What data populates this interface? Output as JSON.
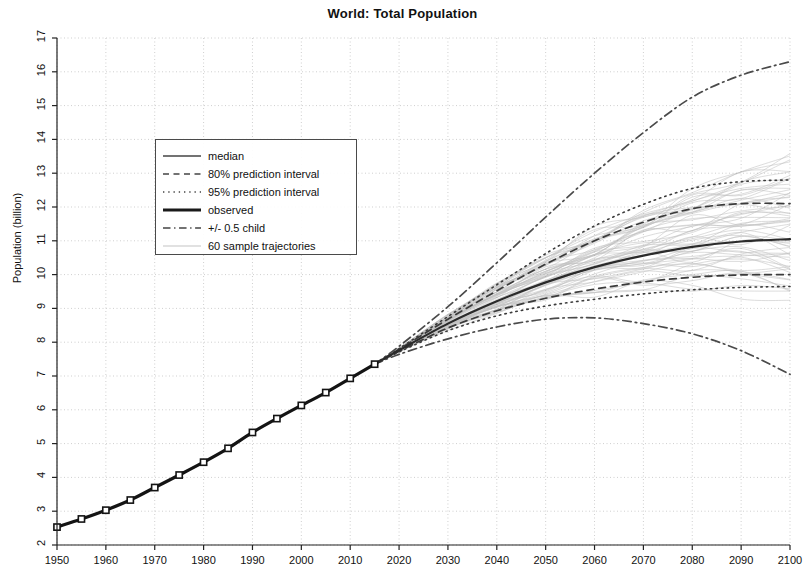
{
  "chart_data": {
    "type": "line",
    "title": "World: Total Population",
    "xlabel": "",
    "ylabel": "Population (billion)",
    "xlim": [
      1950,
      2100
    ],
    "ylim": [
      2,
      17
    ],
    "grid": true,
    "legend_position": "upper left",
    "x_ticks": [
      1950,
      1960,
      1970,
      1980,
      1990,
      2000,
      2010,
      2020,
      2030,
      2040,
      2050,
      2060,
      2070,
      2080,
      2090,
      2100
    ],
    "y_ticks": [
      2,
      3,
      4,
      5,
      6,
      7,
      8,
      9,
      10,
      11,
      12,
      13,
      14,
      15,
      16,
      17
    ],
    "legend": [
      {
        "label": "median",
        "style": "solid",
        "width": 1.5,
        "color": "#444444"
      },
      {
        "label": "80% prediction interval",
        "style": "dashed",
        "width": 1.5,
        "color": "#444444"
      },
      {
        "label": "95% prediction interval",
        "style": "dotted",
        "width": 1.5,
        "color": "#444444"
      },
      {
        "label": "observed",
        "style": "solid",
        "width": 3,
        "color": "#1a1a1a"
      },
      {
        "label": "+/- 0.5 child",
        "style": "dashdot",
        "width": 1.5,
        "color": "#444444"
      },
      {
        "label": "60 sample trajectories",
        "style": "solid",
        "width": 0.6,
        "color": "#9a9a9a"
      }
    ],
    "series": [
      {
        "name": "observed",
        "style": "solid",
        "markers": "square",
        "x": [
          1950,
          1955,
          1960,
          1965,
          1970,
          1975,
          1980,
          1985,
          1990,
          1995,
          2000,
          2005,
          2010,
          2015
        ],
        "values": [
          2.53,
          2.77,
          3.03,
          3.33,
          3.7,
          4.07,
          4.45,
          4.86,
          5.33,
          5.74,
          6.13,
          6.51,
          6.93,
          7.35
        ]
      },
      {
        "name": "median",
        "style": "solid",
        "x": [
          2015,
          2020,
          2030,
          2040,
          2050,
          2060,
          2070,
          2080,
          2090,
          2100
        ],
        "values": [
          7.35,
          7.76,
          8.55,
          9.21,
          9.77,
          10.22,
          10.56,
          10.82,
          10.98,
          11.05
        ]
      },
      {
        "name": "80% prediction interval upper",
        "style": "dashed",
        "x": [
          2015,
          2020,
          2030,
          2040,
          2050,
          2060,
          2070,
          2080,
          2090,
          2100
        ],
        "values": [
          7.35,
          7.79,
          8.68,
          9.52,
          10.31,
          11.0,
          11.55,
          11.95,
          12.1,
          12.1
        ]
      },
      {
        "name": "80% prediction interval lower",
        "style": "dashed",
        "x": [
          2015,
          2020,
          2030,
          2040,
          2050,
          2060,
          2070,
          2080,
          2090,
          2100
        ],
        "values": [
          7.35,
          7.73,
          8.42,
          8.93,
          9.3,
          9.57,
          9.78,
          9.92,
          9.99,
          10.0
        ]
      },
      {
        "name": "95% prediction interval upper",
        "style": "dotted",
        "x": [
          2015,
          2020,
          2030,
          2040,
          2050,
          2060,
          2070,
          2080,
          2090,
          2100
        ],
        "values": [
          7.35,
          7.81,
          8.76,
          9.7,
          10.62,
          11.44,
          12.08,
          12.55,
          12.75,
          12.8
        ]
      },
      {
        "name": "95% prediction interval lower",
        "style": "dotted",
        "x": [
          2015,
          2020,
          2030,
          2040,
          2050,
          2060,
          2070,
          2080,
          2090,
          2100
        ],
        "values": [
          7.35,
          7.71,
          8.34,
          8.78,
          9.07,
          9.27,
          9.43,
          9.55,
          9.62,
          9.65
        ]
      },
      {
        "name": "+/- 0.5 child high",
        "style": "dashdot",
        "x": [
          2015,
          2020,
          2030,
          2040,
          2050,
          2060,
          2070,
          2080,
          2090,
          2100
        ],
        "values": [
          7.35,
          7.88,
          9.05,
          10.35,
          11.7,
          13.0,
          14.2,
          15.25,
          15.9,
          16.3
        ]
      },
      {
        "name": "+/- 0.5 child low",
        "style": "dashdot",
        "x": [
          2015,
          2020,
          2030,
          2040,
          2050,
          2060,
          2070,
          2080,
          2090,
          2100
        ],
        "values": [
          7.35,
          7.64,
          8.1,
          8.45,
          8.68,
          8.72,
          8.55,
          8.25,
          7.75,
          7.05
        ]
      },
      {
        "name": "60 sample trajectories",
        "style": "solid",
        "count": 60,
        "x_start": 2015,
        "x_end": 2100,
        "value_start": 7.35,
        "value_end_min": 9.3,
        "value_end_max": 13.3
      }
    ]
  }
}
